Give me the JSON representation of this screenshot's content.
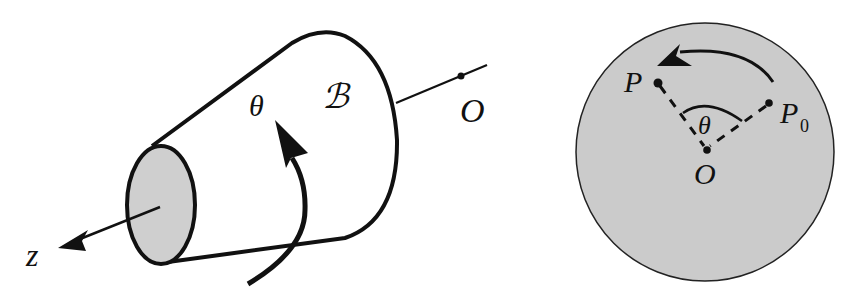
{
  "figure_left": {
    "title": "rigid body rotating about z-axis",
    "labels": {
      "theta": "θ",
      "body": "ℬ",
      "origin": "O",
      "axis": "z"
    },
    "colors": {
      "stroke": "#111111",
      "face_fill": "#cfcfcf",
      "background": "#ffffff"
    }
  },
  "figure_right": {
    "title": "cross-section disk with rotation from P0 to P",
    "labels": {
      "point": "P",
      "point_initial": "P",
      "point_initial_sub": "0",
      "theta": "θ",
      "origin": "O"
    },
    "colors": {
      "disk_fill": "#cbcbcb",
      "stroke": "#111111"
    }
  }
}
